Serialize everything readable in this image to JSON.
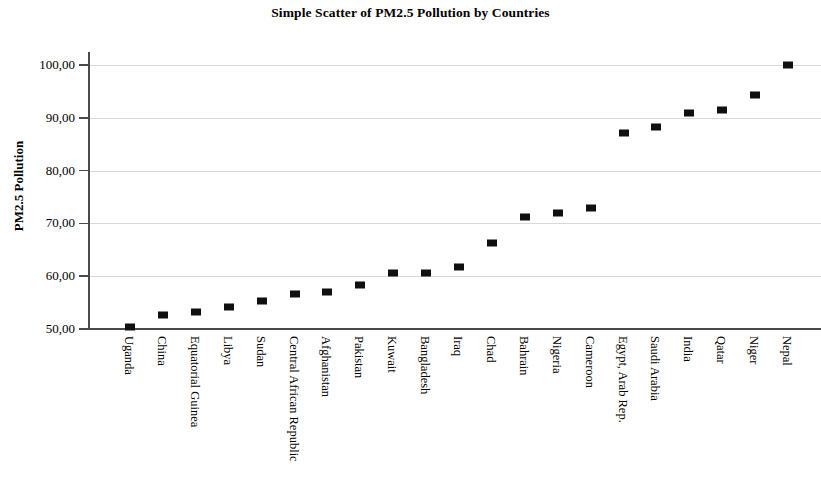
{
  "chart_data": {
    "type": "scatter",
    "title": "Simple Scatter of PM2.5 Pollution by Countries",
    "xlabel": "",
    "ylabel": "PM2.5 Pollution",
    "ylim": [
      50,
      102
    ],
    "grid": true,
    "legend": null,
    "y_ticks": [
      50,
      60,
      70,
      80,
      90,
      100
    ],
    "y_tick_labels": [
      "50,00",
      "60,00",
      "70,00",
      "80,00",
      "90,00",
      "100,00"
    ],
    "categories": [
      "Uganda",
      "China",
      "Equatorial Guinea",
      "Libya",
      "Sudan",
      "Central African Republic",
      "Afghanistan",
      "Pakistan",
      "Kuwait",
      "Bangladesh",
      "Iraq",
      "Chad",
      "Bahrain",
      "Nigeria",
      "Cameroon",
      "Egypt, Arab Rep.",
      "Saudi Arabia",
      "India",
      "Qatar",
      "Niger",
      "Nepal"
    ],
    "values": [
      50.3,
      52.7,
      53.2,
      54.2,
      55.3,
      56.7,
      57.0,
      58.3,
      60.7,
      60.7,
      61.8,
      66.2,
      71.2,
      72.0,
      73.0,
      87.2,
      88.2,
      91.0,
      91.4,
      94.3,
      100.0
    ],
    "marker_color": "#101010",
    "marker_shape": "square"
  }
}
